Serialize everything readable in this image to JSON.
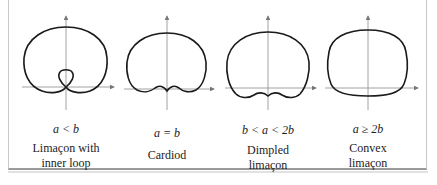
{
  "figure": {
    "panels": [
      {
        "condition": "a < b",
        "name_line1": "Limaçon with",
        "name_line2": "inner loop"
      },
      {
        "condition": "a = b",
        "name_line1": "Cardiod",
        "name_line2": ""
      },
      {
        "condition": "b < a < 2b",
        "name_line1": "Dimpled",
        "name_line2": "limaçon"
      },
      {
        "condition": "a ≥ 2b",
        "name_line1": "Convex",
        "name_line2": "limaçon"
      }
    ]
  },
  "colors": {
    "curve": "#1a1a1a",
    "axis": "#8a8a8a",
    "frame": "#9a9a9a"
  }
}
